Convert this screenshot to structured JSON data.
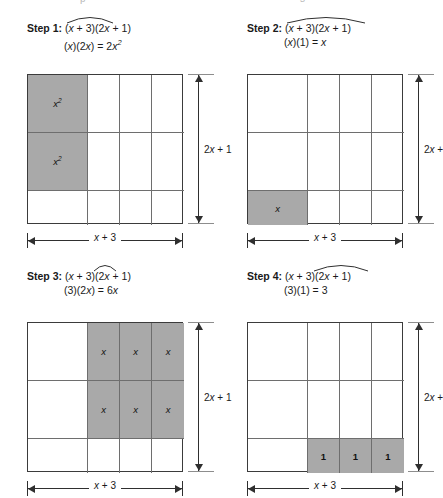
{
  "figure": {
    "shade_color": "#a9a9a9",
    "line_color": "#3b3b3b",
    "top_sliver_left": "p",
    "top_sliver_right": "s"
  },
  "dimensions": {
    "width_label_prefix": "",
    "width_label": "x + 3",
    "width_var": "x",
    "width_rest": " + 3",
    "height_label": "2x + 1",
    "height_full_pre": "2",
    "height_full_var": "x",
    "height_full_post": " + 1",
    "height_clipped": "2x +",
    "height_clipped_pre": "2",
    "height_clipped_var": "x",
    "height_clipped_post": " +"
  },
  "panels": [
    {
      "id": "step-1",
      "step_label": "Step 1:",
      "expression": "(x + 3)(2x + 1)",
      "expr_parts": {
        "a": "(",
        "v1": "x",
        "b": " + 3)(2",
        "v2": "x",
        "c": " + 1)"
      },
      "product_line": "(x)(2x) = 2x²",
      "product_parts": {
        "a": "(",
        "v1": "x",
        "b": ")(2",
        "v2": "x",
        "c": ") = 2",
        "v3": "x",
        "exp": "2"
      },
      "arc": {
        "left": 39,
        "width": 48
      },
      "height_label_clipped": false,
      "shaded_cells": [
        "r0c0",
        "r1c0"
      ],
      "cell_labels": {
        "r0c0": {
          "text": "x",
          "sup": "2",
          "type": "var"
        },
        "r1c0": {
          "text": "x",
          "sup": "2",
          "type": "var"
        }
      }
    },
    {
      "id": "step-2",
      "step_label": "Step 2:",
      "expression": "(x + 3)(2x + 1)",
      "expr_parts": {
        "a": "(",
        "v1": "x",
        "b": " + 3)(2",
        "v2": "x",
        "c": " + 1)"
      },
      "product_line": "(x)(1) = x",
      "product_parts": {
        "a": "(",
        "v1": "x",
        "b": ")(1) = ",
        "v2": "x",
        "c": "",
        "v3": "",
        "exp": ""
      },
      "arc": {
        "left": 39,
        "width": 80
      },
      "height_label_clipped": true,
      "shaded_cells": [
        "r2c0"
      ],
      "cell_labels": {
        "r2c0": {
          "text": "x",
          "sup": "",
          "type": "var"
        }
      }
    },
    {
      "id": "step-3",
      "step_label": "Step 3:",
      "expression": "(x + 3)(2x + 1)",
      "expr_parts": {
        "a": "(",
        "v1": "x",
        "b": " + 3)(2",
        "v2": "x",
        "c": " + 1)"
      },
      "product_line": "(3)(2x) = 6x",
      "product_parts": {
        "a": "(3)(2",
        "v1": "x",
        "b": ") = 6",
        "v2": "x",
        "c": "",
        "v3": "",
        "exp": ""
      },
      "arc": {
        "left": 66,
        "width": 24
      },
      "height_label_clipped": false,
      "shaded_cells": [
        "r0c1",
        "r0c2",
        "r0c3",
        "r1c1",
        "r1c2",
        "r1c3"
      ],
      "cell_labels": {
        "r0c1": {
          "text": "x",
          "sup": "",
          "type": "var"
        },
        "r0c2": {
          "text": "x",
          "sup": "",
          "type": "var"
        },
        "r0c3": {
          "text": "x",
          "sup": "",
          "type": "var"
        },
        "r1c1": {
          "text": "x",
          "sup": "",
          "type": "var"
        },
        "r1c2": {
          "text": "x",
          "sup": "",
          "type": "var"
        },
        "r1c3": {
          "text": "x",
          "sup": "",
          "type": "var"
        }
      }
    },
    {
      "id": "step-4",
      "step_label": "Step 4:",
      "expression": "(x + 3)(2x + 1)",
      "expr_parts": {
        "a": "(",
        "v1": "x",
        "b": " + 3)(2",
        "v2": "x",
        "c": " + 1)"
      },
      "product_line": "(3)(1) = 3",
      "product_parts": {
        "a": "(3)(1) = 3",
        "v1": "",
        "b": "",
        "v2": "",
        "c": "",
        "v3": "",
        "exp": ""
      },
      "arc": {
        "left": 66,
        "width": 56
      },
      "height_label_clipped": true,
      "shaded_cells": [
        "r2c1",
        "r2c2",
        "r2c3"
      ],
      "cell_labels": {
        "r2c1": {
          "text": "1",
          "sup": "",
          "type": "num"
        },
        "r2c2": {
          "text": "1",
          "sup": "",
          "type": "num"
        },
        "r2c3": {
          "text": "1",
          "sup": "",
          "type": "num"
        }
      }
    }
  ],
  "grid_model": {
    "columns": [
      {
        "key": "c0",
        "span": "x",
        "width_px": 60
      },
      {
        "key": "c1",
        "span": "1",
        "width_px": 32
      },
      {
        "key": "c2",
        "span": "1",
        "width_px": 32
      },
      {
        "key": "c3",
        "span": "1",
        "width_px": 32
      }
    ],
    "rows": [
      {
        "key": "r0",
        "span": "x",
        "height_px": 58
      },
      {
        "key": "r1",
        "span": "x",
        "height_px": 58
      },
      {
        "key": "r2",
        "span": "1",
        "height_px": 34
      }
    ]
  }
}
